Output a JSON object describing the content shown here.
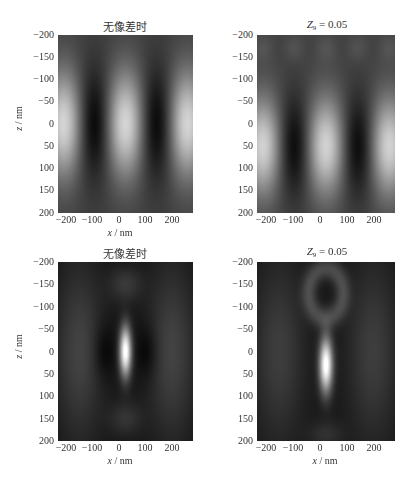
{
  "chart_data": [
    {
      "type": "heatmap",
      "title": "无像差时",
      "xlabel": "x / nm",
      "ylabel": "z / nm",
      "xticks": [
        -200,
        -100,
        0,
        100,
        200
      ],
      "yticks": [
        -200,
        -150,
        -100,
        -50,
        0,
        50,
        100,
        150,
        200
      ],
      "xlim": [
        -250,
        250
      ],
      "ylim": [
        -200,
        200
      ],
      "y_inverted": true,
      "colormap": "gray",
      "pattern": "interference fringes: bright vertical bands at x≈-230, 0, 230 nm; dark bands at x≈-115, 115 nm; centered at z≈0",
      "bright_x": [
        -230,
        0,
        230
      ],
      "dark_x": [
        -115,
        115
      ],
      "center_z": 0
    },
    {
      "type": "heatmap",
      "title": "Z9 = 0.05",
      "xlabel": "x / nm",
      "ylabel": "",
      "xticks": [
        -200,
        -100,
        0,
        100,
        200
      ],
      "yticks": [
        -200,
        -150,
        -100,
        -50,
        0,
        50,
        100,
        150,
        200
      ],
      "xlim": [
        -250,
        250
      ],
      "ylim": [
        -200,
        200
      ],
      "y_inverted": true,
      "colormap": "gray",
      "pattern": "interference fringes shifted downward: bright bands at x≈-230, 0, 230 nm centered near z≈50 nm",
      "bright_x": [
        -230,
        0,
        230
      ],
      "dark_x": [
        -115,
        115
      ],
      "center_z": 50
    },
    {
      "type": "heatmap",
      "title": "无像差时",
      "xlabel": "x / nm",
      "ylabel": "z / nm",
      "xticks": [
        -200,
        -100,
        0,
        100,
        200
      ],
      "yticks": [
        -200,
        -150,
        -100,
        -50,
        0,
        50,
        100,
        150,
        200
      ],
      "xlim": [
        -250,
        250
      ],
      "ylim": [
        -200,
        200
      ],
      "y_inverted": true,
      "colormap": "gray",
      "pattern": "single bright elongated focal spot at x=0, z≈0, with faint side lobes at z≈±150",
      "spot_x": 0,
      "spot_z": 0
    },
    {
      "type": "heatmap",
      "title": "Z9 = 0.05",
      "xlabel": "x / nm",
      "ylabel": "",
      "xticks": [
        -200,
        -100,
        0,
        100,
        200
      ],
      "yticks": [
        -200,
        -150,
        -100,
        -50,
        0,
        50,
        100,
        150,
        200
      ],
      "xlim": [
        -250,
        250
      ],
      "ylim": [
        -200,
        200
      ],
      "y_inverted": true,
      "colormap": "gray",
      "pattern": "bright focal spot shifted to z≈30 nm, with ring-like side lobe above (z≈-130)",
      "spot_x": 0,
      "spot_z": 30
    }
  ],
  "panels": [
    {
      "title": "无像差时",
      "title_sub": "",
      "show_ylabel": true
    },
    {
      "title": "Z",
      "title_sub": "9",
      "title_rest": " = 0.05",
      "show_ylabel": false
    },
    {
      "title": "无像差时",
      "title_sub": "",
      "show_ylabel": true
    },
    {
      "title": "Z",
      "title_sub": "9",
      "title_rest": " = 0.05",
      "show_ylabel": false
    }
  ],
  "axis": {
    "xlabel_var": "x",
    "xlabel_unit": " / nm",
    "ylabel_var": "z",
    "ylabel_unit": " / nm",
    "xticks": [
      "−200",
      "−100",
      "0",
      "100",
      "200"
    ],
    "yticks": [
      "−200",
      "−150",
      "−100",
      "−50",
      "0",
      "50",
      "100",
      "150",
      "200"
    ]
  }
}
